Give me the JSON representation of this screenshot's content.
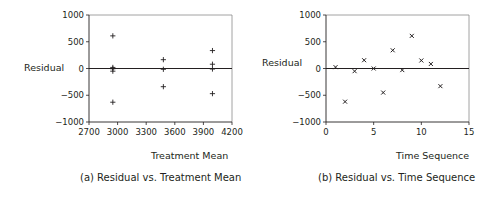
{
  "chart_data": [
    {
      "type": "scatter",
      "title": "(a) Residual vs. Treatment Mean",
      "xlabel": "Treatment Mean",
      "ylabel": "Residual",
      "xlim": [
        2700,
        4200
      ],
      "ylim": [
        -1000,
        1000
      ],
      "xticks": [
        2700,
        3000,
        3300,
        3600,
        3900,
        4200
      ],
      "yticks": [
        1000,
        500,
        0,
        -500,
        -1000
      ],
      "marker": "+",
      "grid": false,
      "reference_line_y": 0,
      "points": [
        {
          "x": 2950,
          "y": 610
        },
        {
          "x": 2950,
          "y": 20
        },
        {
          "x": 2950,
          "y": -5
        },
        {
          "x": 2950,
          "y": -50
        },
        {
          "x": 2950,
          "y": -630
        },
        {
          "x": 3480,
          "y": 165
        },
        {
          "x": 3480,
          "y": -15
        },
        {
          "x": 3480,
          "y": -340
        },
        {
          "x": 3995,
          "y": 335
        },
        {
          "x": 3995,
          "y": 80
        },
        {
          "x": 3995,
          "y": -10
        },
        {
          "x": 3995,
          "y": -470
        }
      ]
    },
    {
      "type": "scatter",
      "title": "(b) Residual vs. Time Sequence",
      "xlabel": "Time Sequence",
      "ylabel": "Residual",
      "xlim": [
        0,
        15
      ],
      "ylim": [
        -1000,
        1000
      ],
      "xticks": [
        0,
        5,
        10,
        15
      ],
      "yticks": [
        1000,
        500,
        0,
        -500,
        -1000
      ],
      "marker": "x",
      "grid": false,
      "reference_line_y": 0,
      "points": [
        {
          "x": 1,
          "y": 25
        },
        {
          "x": 2,
          "y": -620
        },
        {
          "x": 3,
          "y": -50
        },
        {
          "x": 4,
          "y": 155
        },
        {
          "x": 5,
          "y": 0
        },
        {
          "x": 6,
          "y": -450
        },
        {
          "x": 7,
          "y": 340
        },
        {
          "x": 8,
          "y": -30
        },
        {
          "x": 9,
          "y": 610
        },
        {
          "x": 10,
          "y": 150
        },
        {
          "x": 11,
          "y": 85
        },
        {
          "x": 12,
          "y": -330
        }
      ]
    }
  ],
  "panels": {
    "a": {
      "caption": "(a) Residual vs. Treatment Mean",
      "xlabel": "Treatment Mean",
      "ylabel": "Residual"
    },
    "b": {
      "caption": "(b) Residual vs. Time Sequence",
      "xlabel": "Time Sequence",
      "ylabel": "Residual"
    }
  }
}
